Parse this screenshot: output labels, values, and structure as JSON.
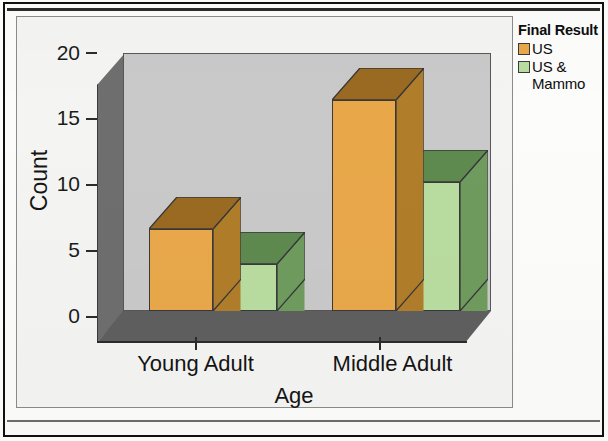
{
  "chart_data": {
    "type": "bar",
    "title": "",
    "subtitle": "",
    "xlabel": "Age",
    "ylabel": "Count",
    "categories": [
      "Young Adult",
      "Middle Adult"
    ],
    "series": [
      {
        "name": "US",
        "values": [
          7,
          18
        ],
        "color": "#E8A84A"
      },
      {
        "name": "US & Mammo",
        "values": [
          4,
          11
        ],
        "color": "#B9DCA0"
      }
    ],
    "ylim": [
      0,
      22
    ],
    "yticks": [
      0,
      5,
      10,
      15,
      20
    ],
    "ytick_labels": [
      "0",
      "5",
      "10",
      "15",
      "20"
    ],
    "grid": false,
    "legend_position": "right",
    "legend_title": "Final Result",
    "style": "spss-3d-clustered-bar"
  },
  "legend": {
    "title": "Final Result",
    "items": [
      {
        "label": "US",
        "color": "#E8A84A"
      },
      {
        "label": "US & Mammo",
        "color": "#B9DCA0"
      }
    ]
  },
  "axes": {
    "y_title": "Count",
    "x_title": "Age",
    "y_tick_labels": [
      "20",
      "15",
      "10",
      "5",
      "0"
    ],
    "x_categories": [
      "Young Adult",
      "Middle Adult"
    ]
  },
  "colors": {
    "series_us_front": "#E8A84A",
    "series_us_top": "#9A6A22",
    "series_us_side": "#B07D2A",
    "series_mammo_front": "#B9DCA0",
    "series_mammo_top": "#5E8A50",
    "series_mammo_side": "#6F9B5E",
    "back_wall": "#C9C9C9",
    "left_wall": "#6E6E6E",
    "floor": "#5F5F5F",
    "chart_background": "#F4F5F3",
    "axis_text": "#141414"
  }
}
